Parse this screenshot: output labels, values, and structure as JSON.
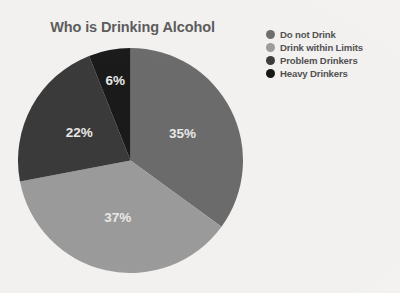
{
  "background_color": "#f2f1ef",
  "chart_data": {
    "type": "pie",
    "title": "Who is Drinking Alcohol",
    "xlabel": "",
    "ylabel": "",
    "legend_position": "right",
    "grid": false,
    "start_angle_deg": 0,
    "direction": "clockwise",
    "categories": [
      "Do not Drink",
      "Drink within Limits",
      "Problem Drinkers",
      "Heavy Drinkers"
    ],
    "values": [
      35,
      37,
      22,
      6
    ],
    "value_labels": [
      "35%",
      "37%",
      "22%",
      "6%"
    ],
    "colors": [
      "#6b6b6b",
      "#9a9a9a",
      "#3a3a3a",
      "#1a1a1a"
    ],
    "slices": [
      {
        "label": "Do not Drink",
        "value": 35,
        "value_label": "35%",
        "color": "#6b6b6b",
        "start_deg": 0,
        "end_deg": 126
      },
      {
        "label": "Drink within Limits",
        "value": 37,
        "value_label": "37%",
        "color": "#9a9a9a",
        "start_deg": 126,
        "end_deg": 259.2
      },
      {
        "label": "Problem Drinkers",
        "value": 22,
        "value_label": "22%",
        "color": "#3a3a3a",
        "start_deg": 259.2,
        "end_deg": 338.4
      },
      {
        "label": "Heavy Drinkers",
        "value": 6,
        "value_label": "6%",
        "color": "#1a1a1a",
        "start_deg": 338.4,
        "end_deg": 360
      }
    ]
  },
  "legend": {
    "items": [
      {
        "label": "Do not Drink",
        "color": "#6b6b6b"
      },
      {
        "label": "Drink within Limits",
        "color": "#9a9a9a"
      },
      {
        "label": "Problem Drinkers",
        "color": "#3a3a3a"
      },
      {
        "label": "Heavy Drinkers",
        "color": "#141414"
      }
    ]
  },
  "labels": {
    "title_color": "#5a5a5a",
    "slice_label_color": "#e9e8e6"
  }
}
